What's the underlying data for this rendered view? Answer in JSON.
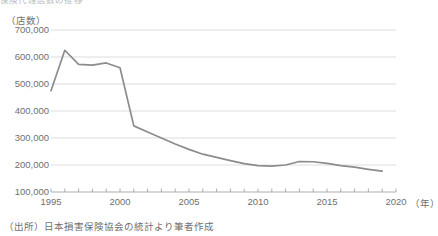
{
  "figure": {
    "title_cut_off": "保険代理店数の推移",
    "source_note": "（出所）日本損害保険協会の統計より筆者作成"
  },
  "chart_data": {
    "type": "line",
    "title": "保険代理店数の推移",
    "xlabel": "（年）",
    "ylabel": "（店数）",
    "xlim": [
      1995,
      2020
    ],
    "ylim": [
      100000,
      700000
    ],
    "ytick_step": 100000,
    "grid": "horizontal",
    "legend": "none",
    "line_color": "#8c8c8c",
    "ytick_labels": [
      "700,000",
      "600,000",
      "500,000",
      "400,000",
      "300,000",
      "200,000",
      "100,000"
    ],
    "ytick_values": [
      700000,
      600000,
      500000,
      400000,
      300000,
      200000,
      100000
    ],
    "xtick_labels": [
      "1995",
      "2000",
      "2005",
      "2010",
      "2015",
      "2020"
    ],
    "xtick_values": [
      1995,
      2000,
      2005,
      2010,
      2015,
      2020
    ],
    "xtick_minor_step": 1,
    "x": [
      1995,
      1996,
      1997,
      1998,
      1999,
      2000,
      2001,
      2002,
      2003,
      2004,
      2005,
      2006,
      2007,
      2008,
      2009,
      2010,
      2011,
      2012,
      2013,
      2014,
      2015,
      2016,
      2017,
      2018,
      2019
    ],
    "values": [
      475000,
      625000,
      573000,
      570000,
      578000,
      560000,
      345000,
      322000,
      300000,
      278000,
      258000,
      240000,
      228000,
      216000,
      205000,
      198000,
      196000,
      200000,
      213000,
      212000,
      206000,
      198000,
      192000,
      184000,
      177000
    ],
    "series": [
      {
        "name": "店数",
        "values": [
          475000,
          625000,
          573000,
          570000,
          578000,
          560000,
          345000,
          322000,
          300000,
          278000,
          258000,
          240000,
          228000,
          216000,
          205000,
          198000,
          196000,
          200000,
          213000,
          212000,
          206000,
          198000,
          192000,
          184000,
          177000
        ]
      }
    ]
  }
}
